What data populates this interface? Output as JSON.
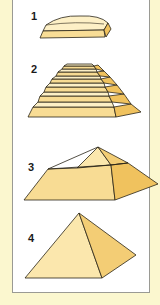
{
  "figure": {
    "stages": [
      {
        "label": "1",
        "shape": "mastaba"
      },
      {
        "label": "2",
        "shape": "step-pyramid"
      },
      {
        "label": "3",
        "shape": "bent-pyramid"
      },
      {
        "label": "4",
        "shape": "true-pyramid"
      }
    ]
  },
  "colors": {
    "background": "#fbf7cf",
    "panel": "#ffffff",
    "panel_border": "#9a9a94",
    "stone_light": "#fbe7ad",
    "stone_mid": "#f6d88c",
    "stone_dark": "#f0c25e",
    "outline": "#2a2418"
  }
}
